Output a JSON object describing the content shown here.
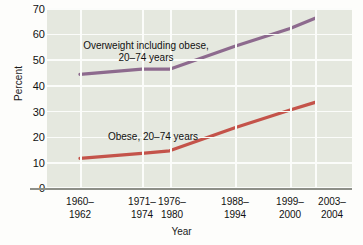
{
  "chart_data": {
    "type": "line",
    "title": "",
    "xlabel": "Year",
    "ylabel": "Percent",
    "categories": [
      "1960–1962",
      "1971–1974",
      "1976–1980",
      "1988–1994",
      "1999–2000",
      "2003–2004"
    ],
    "x_positions": [
      0.108,
      0.311,
      0.402,
      0.616,
      0.797,
      0.879
    ],
    "ylim": [
      0,
      70
    ],
    "yticks": [
      0,
      10,
      20,
      30,
      40,
      50,
      60,
      70
    ],
    "grid": true,
    "legend_position": "inline-annotation",
    "series": [
      {
        "name": "Overweight including obese, 20–74 years",
        "color": "#8d6a8e",
        "values": [
          44,
          46,
          46,
          55,
          62,
          66
        ]
      },
      {
        "name": "Obese, 20–74 years",
        "color": "#c4534a",
        "values": [
          11,
          13,
          14,
          23,
          30,
          33
        ]
      }
    ],
    "annotations": [
      {
        "id": "overweight",
        "text": "Overweight including obese,\n20–74 years"
      },
      {
        "id": "obese",
        "text": "Obese, 20–74 years"
      }
    ]
  },
  "axes": {
    "y_title": "Percent",
    "x_title": "Year",
    "y_tick_labels": [
      "70",
      "60",
      "50",
      "40",
      "30",
      "20",
      "10",
      "0"
    ],
    "x_tick_labels": [
      {
        "top": "1960–",
        "bottom": "1962"
      },
      {
        "top": "1971–",
        "bottom": "1974"
      },
      {
        "top": "1976–",
        "bottom": "1980"
      },
      {
        "top": "1988–",
        "bottom": "1994"
      },
      {
        "top": "1999–",
        "bottom": "2000"
      },
      {
        "top": "2003–",
        "bottom": "2004"
      }
    ]
  },
  "colors": {
    "plot_background": "#e5e8df",
    "gridline": "#fbfcfa",
    "axis_line": "#8d8f88",
    "overweight_line": "#8d6a8e",
    "obese_line": "#c4534a",
    "text": "#111111",
    "page_background": "#fdfdfb"
  }
}
